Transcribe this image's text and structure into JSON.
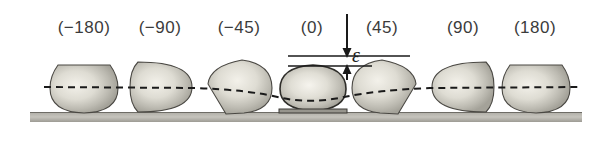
{
  "figure": {
    "background_color": "#ffffff",
    "ground": {
      "name": "substrate",
      "color": "#b4b2ab"
    },
    "centerline": {
      "style": "dashed",
      "color": "#1a1a1a"
    }
  },
  "labels": [
    {
      "text": "(−180)",
      "x": 84,
      "angle": -180
    },
    {
      "text": "(−90)",
      "x": 160,
      "angle": -90
    },
    {
      "text": "(−45)",
      "x": 239,
      "angle": -45
    },
    {
      "text": "(0)",
      "x": 312,
      "angle": 0
    },
    {
      "text": "(45)",
      "x": 382,
      "angle": 45
    },
    {
      "text": "(90)",
      "x": 463,
      "angle": 90
    },
    {
      "text": "(180)",
      "x": 535,
      "angle": 180
    }
  ],
  "annotation": {
    "symbol": "ε",
    "meaning": "deformation-gap",
    "arrow_down": "down-arrow",
    "arrow_up": "up-arrow"
  },
  "shapes": [
    {
      "name": "shape-minus-180",
      "cx": 84,
      "facet": "top-flat"
    },
    {
      "name": "shape-minus-90",
      "cx": 160,
      "facet": "left-flat"
    },
    {
      "name": "shape-minus-45",
      "cx": 239,
      "facet": "bottom-left-point"
    },
    {
      "name": "shape-zero",
      "cx": 312,
      "facet": "flattened-base"
    },
    {
      "name": "shape-45",
      "cx": 382,
      "facet": "bottom-right-point"
    },
    {
      "name": "shape-90",
      "cx": 463,
      "facet": "right-flat"
    },
    {
      "name": "shape-180",
      "cx": 535,
      "facet": "top-flat"
    }
  ]
}
